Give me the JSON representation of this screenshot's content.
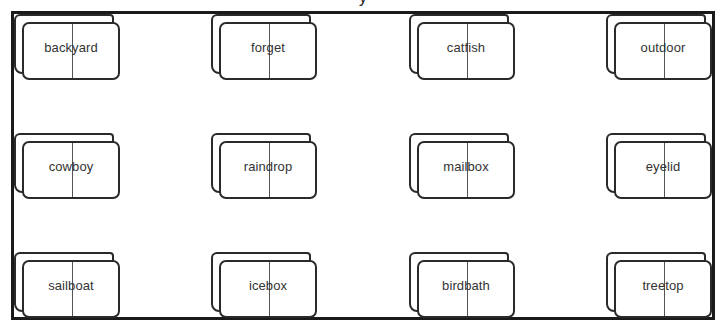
{
  "title_fragment": "y",
  "grid": {
    "rows": 3,
    "columns": 4
  },
  "cards": [
    {
      "word": "backyard",
      "row": 0,
      "col": 0
    },
    {
      "word": "forget",
      "row": 0,
      "col": 1
    },
    {
      "word": "catfish",
      "row": 0,
      "col": 2
    },
    {
      "word": "outdoor",
      "row": 0,
      "col": 3
    },
    {
      "word": "cowboy",
      "row": 1,
      "col": 0
    },
    {
      "word": "raindrop",
      "row": 1,
      "col": 1
    },
    {
      "word": "mailbox",
      "row": 1,
      "col": 2
    },
    {
      "word": "eyelid",
      "row": 1,
      "col": 3
    },
    {
      "word": "sailboat",
      "row": 2,
      "col": 0
    },
    {
      "word": "icebox",
      "row": 2,
      "col": 1
    },
    {
      "word": "birdbath",
      "row": 2,
      "col": 2
    },
    {
      "word": "treetop",
      "row": 2,
      "col": 3
    }
  ],
  "colors": {
    "frame": "#1a1a1a",
    "card_outline": "#2a2a2a",
    "divider": "#555555",
    "text": "#333333",
    "background": "#ffffff"
  }
}
